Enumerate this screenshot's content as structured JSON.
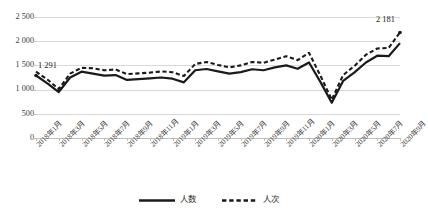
{
  "chart_data": {
    "type": "line",
    "title": "",
    "xlabel": "",
    "ylabel": "",
    "ylim": [
      0,
      2500
    ],
    "y_ticks": [
      "0",
      "500",
      "1 000",
      "1 500",
      "2 000",
      "2 500"
    ],
    "y_tick_values": [
      0,
      500,
      1000,
      1500,
      2000,
      2500
    ],
    "grid": true,
    "legend_position": "bottom",
    "x": [
      "2018年1月",
      "2018年2月",
      "2018年3月",
      "2018年4月",
      "2018年5月",
      "2018年6月",
      "2018年7月",
      "2018年8月",
      "2018年9月",
      "2018年10月",
      "2018年11月",
      "2018年12月",
      "2019年1月",
      "2019年2月",
      "2019年3月",
      "2019年4月",
      "2019年5月",
      "2019年6月",
      "2019年7月",
      "2019年8月",
      "2019年9月",
      "2019年10月",
      "2019年11月",
      "2019年12月",
      "2020年1月",
      "2020年2月",
      "2020年3月",
      "2020年4月",
      "2020年5月",
      "2020年6月",
      "2020年7月",
      "2020年8月",
      "2020年9月"
    ],
    "x_tick_labels": [
      "2018年1月",
      "2018年3月",
      "2018年5月",
      "2018年7月",
      "2018年9月",
      "2018年11月",
      "2019年1月",
      "2019年3月",
      "2019年5月",
      "2019年7月",
      "2019年9月",
      "2019年11月",
      "2020年1月",
      "2020年3月",
      "2020年5月",
      "2020年7月",
      "2020年9月"
    ],
    "x_tick_indices": [
      0,
      2,
      4,
      6,
      8,
      10,
      12,
      14,
      16,
      18,
      20,
      22,
      24,
      26,
      28,
      30,
      32
    ],
    "series": [
      {
        "name": "人数",
        "style": "solid",
        "color": "#1a1a1a",
        "values": [
          1291,
          1130,
          950,
          1250,
          1370,
          1330,
          1290,
          1300,
          1200,
          1215,
          1230,
          1250,
          1225,
          1150,
          1400,
          1425,
          1375,
          1330,
          1360,
          1420,
          1400,
          1460,
          1500,
          1430,
          1560,
          1160,
          730,
          1180,
          1355,
          1560,
          1700,
          1690,
          1960
        ]
      },
      {
        "name": "人次",
        "style": "dashed",
        "color": "#1a1a1a",
        "values": [
          1370,
          1210,
          1010,
          1330,
          1450,
          1440,
          1400,
          1415,
          1320,
          1335,
          1350,
          1375,
          1360,
          1280,
          1530,
          1570,
          1510,
          1460,
          1500,
          1570,
          1555,
          1620,
          1690,
          1610,
          1760,
          1290,
          790,
          1300,
          1490,
          1720,
          1850,
          1860,
          2181
        ]
      }
    ],
    "annotations": [
      {
        "text": "1 291",
        "series": "人数",
        "index": 0,
        "value": 1291
      },
      {
        "text": "2 181",
        "series": "人次",
        "index": 32,
        "value": 2181
      }
    ]
  },
  "legend": {
    "items": [
      {
        "label": "人数",
        "style": "solid"
      },
      {
        "label": "人次",
        "style": "dashed"
      }
    ]
  }
}
